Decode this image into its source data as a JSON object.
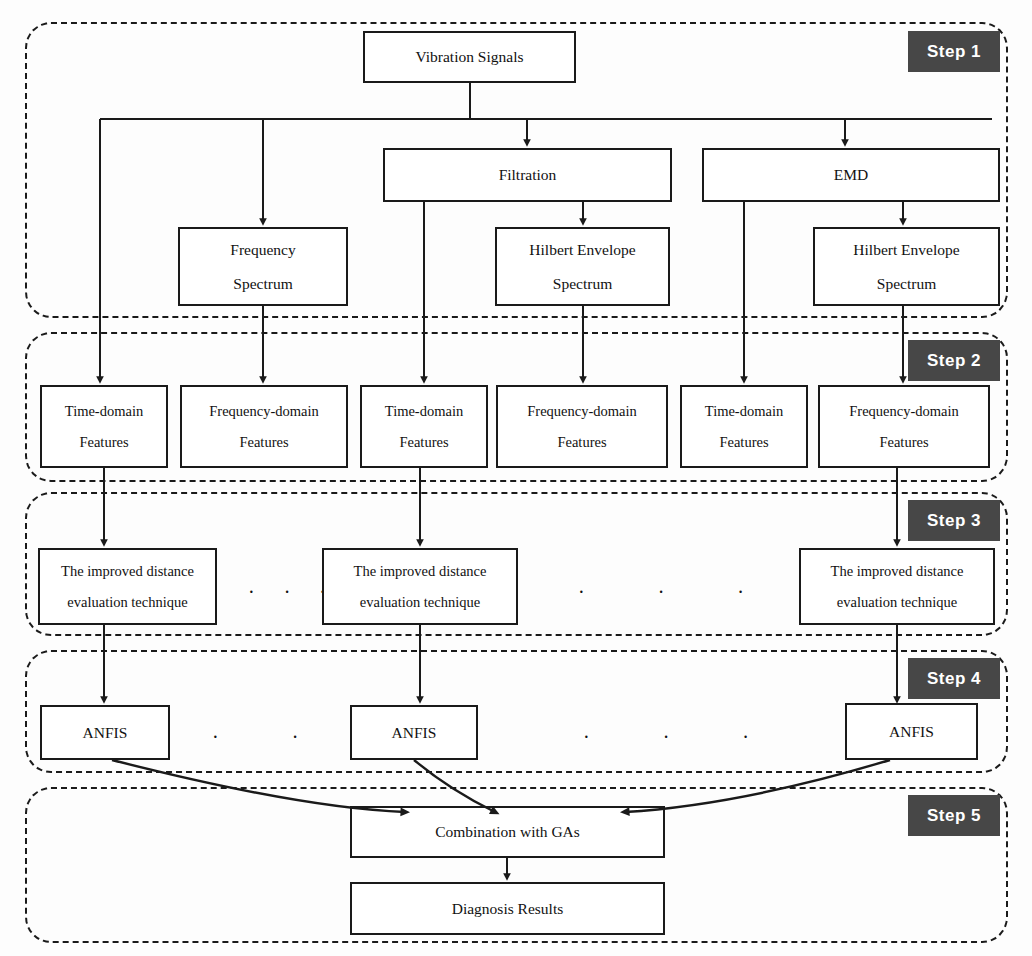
{
  "diagram": {
    "line_color": "#1a1a1a",
    "badge_bg": "#474747",
    "badge_fg": "#ffffff",
    "box_fill": "#ffffff"
  },
  "steps": [
    {
      "label": "Step 1"
    },
    {
      "label": "Step 2"
    },
    {
      "label": "Step 3"
    },
    {
      "label": "Step 4"
    },
    {
      "label": "Step 5"
    }
  ],
  "nodes": {
    "vibration_signals": {
      "line1": "Vibration Signals",
      "line2": ""
    },
    "filtration": {
      "line1": "Filtration",
      "line2": ""
    },
    "emd": {
      "line1": "EMD",
      "line2": ""
    },
    "frequency_spectrum": {
      "line1": "Frequency",
      "line2": "Spectrum"
    },
    "hilbert_envelope_1": {
      "line1": "Hilbert Envelope",
      "line2": "Spectrum"
    },
    "hilbert_envelope_2": {
      "line1": "Hilbert Envelope",
      "line2": "Spectrum"
    },
    "time_domain_1": {
      "line1": "Time-domain",
      "line2": "Features"
    },
    "frequency_domain_1": {
      "line1": "Frequency-domain",
      "line2": "Features"
    },
    "time_domain_2": {
      "line1": "Time-domain",
      "line2": "Features"
    },
    "frequency_domain_2": {
      "line1": "Frequency-domain",
      "line2": "Features"
    },
    "time_domain_3": {
      "line1": "Time-domain",
      "line2": "Features"
    },
    "frequency_domain_3": {
      "line1": "Frequency-domain",
      "line2": "Features"
    },
    "ide_1": {
      "line1": "The improved distance",
      "line2": "evaluation technique"
    },
    "ide_2": {
      "line1": "The improved distance",
      "line2": "evaluation technique"
    },
    "ide_3": {
      "line1": "The improved distance",
      "line2": "evaluation technique"
    },
    "anfis_1": {
      "line1": "ANFIS",
      "line2": ""
    },
    "anfis_2": {
      "line1": "ANFIS",
      "line2": ""
    },
    "anfis_3": {
      "line1": "ANFIS",
      "line2": ""
    },
    "combination_gas": {
      "line1": "Combination with GAs",
      "line2": ""
    },
    "diagnosis_results": {
      "line1": "Diagnosis Results",
      "line2": ""
    }
  },
  "ellipsis": {
    "step3_left": "·  ·  ·",
    "step3_right": "·      ·      ·",
    "step4_left": "·      ·      ·",
    "step4_right": "·      ·      ·"
  }
}
